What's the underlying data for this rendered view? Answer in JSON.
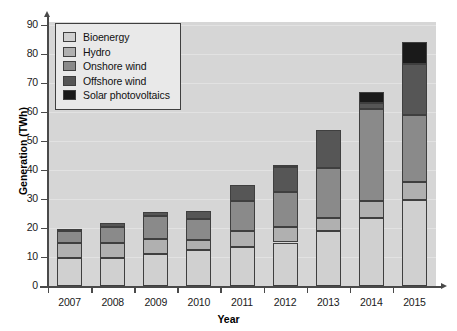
{
  "chart_data": {
    "type": "bar",
    "subtype": "stacked-bar",
    "title": "",
    "xlabel": "Year",
    "ylabel": "Generation (TWh)",
    "categories": [
      "2007",
      "2008",
      "2009",
      "2010",
      "2011",
      "2012",
      "2013",
      "2014",
      "2015"
    ],
    "ylim": [
      0,
      90
    ],
    "yticks": [
      0,
      10,
      20,
      30,
      40,
      50,
      60,
      70,
      80,
      90
    ],
    "grid": true,
    "legend_position": "top-left",
    "series": [
      {
        "name": "Bioenergy",
        "color": "#d0d0d0",
        "values": [
          9.5,
          9.5,
          10.9,
          12.3,
          13.4,
          15.0,
          19.0,
          23.3,
          29.5
        ]
      },
      {
        "name": "Hydro",
        "color": "#b0b0b0",
        "values": [
          5.2,
          5.2,
          5.3,
          3.5,
          5.6,
          5.3,
          4.3,
          5.9,
          6.3
        ]
      },
      {
        "name": "Onshore wind",
        "color": "#8a8a8a",
        "values": [
          4.4,
          5.8,
          8.1,
          7.4,
          10.2,
          12.2,
          17.4,
          31.8,
          23.2
        ]
      },
      {
        "name": "Offshore wind",
        "color": "#565656",
        "values": [
          0.7,
          1.2,
          1.2,
          2.8,
          5.8,
          8.5,
          13.0,
          2.0,
          17.5
        ]
      },
      {
        "name": "Solar photovoltaics",
        "color": "#1a1a1a",
        "values": [
          0.0,
          0.0,
          0.0,
          0.0,
          0.0,
          0.7,
          0.0,
          4.0,
          7.5
        ]
      }
    ],
    "totals": [
      19.8,
      21.7,
      25.5,
      26.0,
      35.0,
      41.7,
      53.7,
      65.0,
      84.0
    ]
  }
}
